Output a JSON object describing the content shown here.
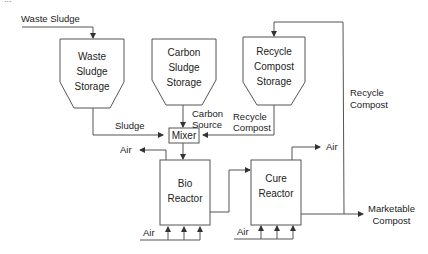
{
  "diagram": {
    "type": "process-flow",
    "partial_header": "...",
    "inputs": {
      "waste_sludge": "Waste Sludge"
    },
    "storage": [
      {
        "id": "waste",
        "lines": [
          "Waste",
          "Sludge",
          "Storage"
        ]
      },
      {
        "id": "carbon",
        "lines": [
          "Carbon",
          "Sludge",
          "Storage"
        ]
      },
      {
        "id": "recycle",
        "lines": [
          "Recycle",
          "Compost",
          "Storage"
        ]
      }
    ],
    "mixer": {
      "label": "Mixer"
    },
    "flows": {
      "sludge": "Sludge",
      "carbon_source": [
        "Carbon",
        "Source"
      ],
      "recycle_compost_in": [
        "Recycle",
        "Compost"
      ],
      "recycle_compost_loop": [
        "Recycle",
        "Compost"
      ],
      "marketable_compost": [
        "Marketable",
        "Compost"
      ]
    },
    "reactors": [
      {
        "id": "bio",
        "lines": [
          "Bio",
          "Reactor"
        ],
        "air_out": "Air",
        "air_in": "Air"
      },
      {
        "id": "cure",
        "lines": [
          "Cure",
          "Reactor"
        ],
        "air_out": "Air",
        "air_in": "Air"
      }
    ],
    "colors": {
      "line": "#555555",
      "text": "#222222",
      "background": "#ffffff"
    }
  }
}
